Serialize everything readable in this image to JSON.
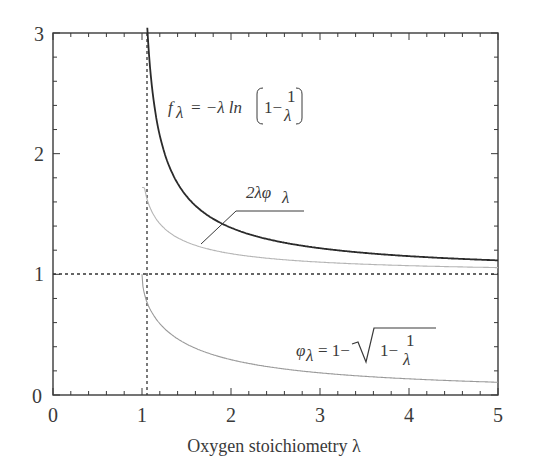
{
  "chart_data": {
    "type": "line",
    "title": "",
    "xlabel": "Oxygen stoichiometry λ",
    "ylabel": "",
    "xlim": [
      0,
      5
    ],
    "ylim": [
      0,
      3
    ],
    "xticks": [
      "0",
      "1",
      "2",
      "3",
      "4",
      "5"
    ],
    "yticks": [
      "0",
      "1",
      "2",
      "3"
    ],
    "grid": false,
    "legend": "none (inline annotations)",
    "series": [
      {
        "name": "f_λ = −λ ln(1 − 1/λ)",
        "color": "#2b2b2b",
        "style": "solid-thick",
        "x": [
          1.05,
          1.1,
          1.2,
          1.3,
          1.5,
          1.75,
          2.0,
          2.5,
          3.0,
          3.5,
          4.0,
          4.5,
          5.0
        ],
        "values": [
          3.2,
          2.64,
          2.15,
          1.88,
          1.65,
          1.48,
          1.39,
          1.28,
          1.22,
          1.18,
          1.15,
          1.13,
          1.12
        ]
      },
      {
        "name": "2λφ_λ",
        "color": "#b0b0b0",
        "style": "solid-thin",
        "x": [
          1.0,
          1.05,
          1.1,
          1.2,
          1.3,
          1.5,
          1.75,
          2.0,
          2.5,
          3.0,
          3.5,
          4.0,
          4.5,
          5.0
        ],
        "values": [
          2.0,
          1.66,
          1.54,
          1.41,
          1.33,
          1.27,
          1.2,
          1.17,
          1.13,
          1.1,
          1.08,
          1.07,
          1.06,
          1.05
        ]
      },
      {
        "name": "φ_λ = 1 − √(1 − 1/λ)",
        "color": "#9a9a9a",
        "style": "solid-thin",
        "x": [
          1.0,
          1.05,
          1.1,
          1.2,
          1.3,
          1.5,
          1.75,
          2.0,
          2.5,
          3.0,
          3.5,
          4.0,
          4.5,
          5.0
        ],
        "values": [
          1.0,
          0.78,
          0.7,
          0.59,
          0.52,
          0.42,
          0.34,
          0.29,
          0.23,
          0.18,
          0.15,
          0.13,
          0.12,
          0.11
        ]
      }
    ],
    "reference_lines": [
      {
        "orientation": "vertical",
        "x": 1,
        "style": "dashed"
      },
      {
        "orientation": "horizontal",
        "y": 1,
        "style": "dashed"
      }
    ],
    "annotations": [
      {
        "text": "f_λ = −λ ln(1 − 1/λ)",
        "x": 1.6,
        "y": 2.3
      },
      {
        "text": "2λφ_λ",
        "x": 2.2,
        "y": 1.5,
        "leader_to": [
          1.6,
          1.23
        ]
      },
      {
        "text": "φ_λ = 1 − √(1 − 1/λ)",
        "x": 2.3,
        "y": 0.55
      }
    ]
  },
  "labels": {
    "xlabel": "Oxygen stoichiometry λ",
    "xticks": [
      "0",
      "1",
      "2",
      "3",
      "4",
      "5"
    ],
    "yticks": [
      "0",
      "1",
      "2",
      "3"
    ],
    "f_lhs": "f",
    "f_sub": "λ",
    "f_rhs": "= −λ ln",
    "f_one": "1−",
    "frac_num": "1",
    "frac_den": "λ",
    "mid_label": "2λφ",
    "mid_sub": "λ",
    "phi_lhs": "φ",
    "phi_sub": "λ",
    "phi_rhs": "= 1−",
    "phi_inner": "1−"
  }
}
